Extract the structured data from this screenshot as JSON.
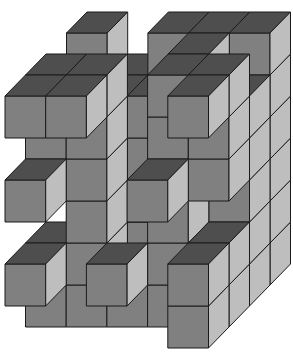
{
  "title": "Stacked cube structure",
  "diagram": {
    "type": "voxel-oblique",
    "projection": {
      "origin_x": 5,
      "origin_y": 348,
      "cube_width": 40.7,
      "cube_height": 42,
      "depth_dx": 20.5,
      "depth_dy": -21
    },
    "colors": {
      "background": "#ffffff",
      "front": "#808080",
      "top": "#4e4e4e",
      "side": "#bebebe",
      "outline": "#1a1a1a"
    },
    "dimensions": {
      "cols": 5,
      "rows": 6,
      "depth": 4
    },
    "voxels": [
      [
        0,
        0,
        3
      ],
      [
        1,
        0,
        3
      ],
      [
        2,
        0,
        3
      ],
      [
        3,
        0,
        3
      ],
      [
        4,
        0,
        3
      ],
      [
        0,
        1,
        3
      ],
      [
        1,
        1,
        3
      ],
      [
        2,
        1,
        3
      ],
      [
        3,
        1,
        3
      ],
      [
        4,
        1,
        3
      ],
      [
        0,
        2,
        3
      ],
      [
        1,
        2,
        3
      ],
      [
        2,
        2,
        3
      ],
      [
        3,
        2,
        3
      ],
      [
        4,
        2,
        3
      ],
      [
        0,
        3,
        3
      ],
      [
        1,
        3,
        3
      ],
      [
        2,
        3,
        3
      ],
      [
        3,
        3,
        3
      ],
      [
        4,
        3,
        3
      ],
      [
        0,
        4,
        3
      ],
      [
        1,
        4,
        3
      ],
      [
        2,
        4,
        3
      ],
      [
        3,
        4,
        3
      ],
      [
        4,
        4,
        3
      ],
      [
        0,
        5,
        3
      ],
      [
        2,
        5,
        3
      ],
      [
        3,
        5,
        3
      ],
      [
        4,
        5,
        3
      ],
      [
        1,
        0,
        2
      ],
      [
        2,
        0,
        2
      ],
      [
        3,
        0,
        2
      ],
      [
        4,
        0,
        2
      ],
      [
        2,
        1,
        2
      ],
      [
        4,
        1,
        2
      ],
      [
        1,
        2,
        2
      ],
      [
        2,
        2,
        2
      ],
      [
        3,
        2,
        2
      ],
      [
        4,
        2,
        2
      ],
      [
        0,
        3,
        2
      ],
      [
        2,
        3,
        2
      ],
      [
        4,
        3,
        2
      ],
      [
        1,
        4,
        2
      ],
      [
        2,
        4,
        2
      ],
      [
        3,
        4,
        2
      ],
      [
        4,
        4,
        2
      ],
      [
        3,
        5,
        2
      ],
      [
        0,
        0,
        1
      ],
      [
        1,
        0,
        1
      ],
      [
        2,
        0,
        1
      ],
      [
        3,
        0,
        1
      ],
      [
        4,
        0,
        1
      ],
      [
        0,
        1,
        1
      ],
      [
        1,
        1,
        1
      ],
      [
        3,
        1,
        1
      ],
      [
        4,
        1,
        1
      ],
      [
        1,
        2,
        1
      ],
      [
        3,
        2,
        1
      ],
      [
        0,
        3,
        1
      ],
      [
        1,
        3,
        1
      ],
      [
        4,
        3,
        1
      ],
      [
        0,
        4,
        1
      ],
      [
        1,
        4,
        1
      ],
      [
        3,
        4,
        1
      ],
      [
        4,
        4,
        1
      ],
      [
        0,
        5,
        1
      ],
      [
        1,
        5,
        1
      ],
      [
        3,
        5,
        1
      ],
      [
        4,
        5,
        1
      ],
      [
        4,
        0,
        0
      ],
      [
        4,
        1,
        0
      ],
      [
        0,
        1,
        0
      ],
      [
        2,
        1,
        0
      ],
      [
        0,
        3,
        0
      ],
      [
        3,
        3,
        0
      ],
      [
        0,
        5,
        0
      ],
      [
        1,
        5,
        0
      ],
      [
        4,
        5,
        0
      ]
    ]
  }
}
